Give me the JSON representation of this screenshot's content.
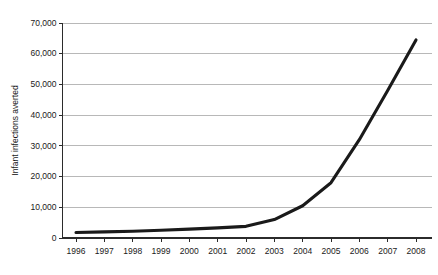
{
  "chart_data": {
    "type": "line",
    "title": "",
    "subtitle": "",
    "xlabel": "",
    "ylabel": "Infant infections averted",
    "categories": [
      "1996",
      "1997",
      "1998",
      "1999",
      "2000",
      "2001",
      "2002",
      "2003",
      "2004",
      "2005",
      "2006",
      "2007",
      "2008"
    ],
    "x": [
      1996,
      1997,
      1998,
      1999,
      2000,
      2001,
      2002,
      2003,
      2004,
      2005,
      2006,
      2007,
      2008
    ],
    "values": [
      1800,
      2000,
      2200,
      2500,
      2900,
      3300,
      3800,
      6000,
      10500,
      18000,
      32000,
      48000,
      64500
    ],
    "series": [
      {
        "name": "Infant infections averted",
        "values": [
          1800,
          2000,
          2200,
          2500,
          2900,
          3300,
          3800,
          6000,
          10500,
          18000,
          32000,
          48000,
          64500
        ],
        "color": "#1a1a1a"
      }
    ],
    "ylim": [
      0,
      70000
    ],
    "xlim": [
      1996,
      2008
    ],
    "yticks": [
      0,
      10000,
      20000,
      30000,
      40000,
      50000,
      60000,
      70000
    ],
    "ytick_labels": [
      "0",
      "10,000",
      "20,000",
      "30,000",
      "40,000",
      "50,000",
      "60,000",
      "70,000"
    ],
    "grid": true,
    "grid_axis": "y",
    "legend": false,
    "legend_position": "none",
    "background": "#ffffff",
    "line_color": "#1a1a1a",
    "gridline_color": "#9a9a9a",
    "axis_color": "#2b2b2b"
  }
}
